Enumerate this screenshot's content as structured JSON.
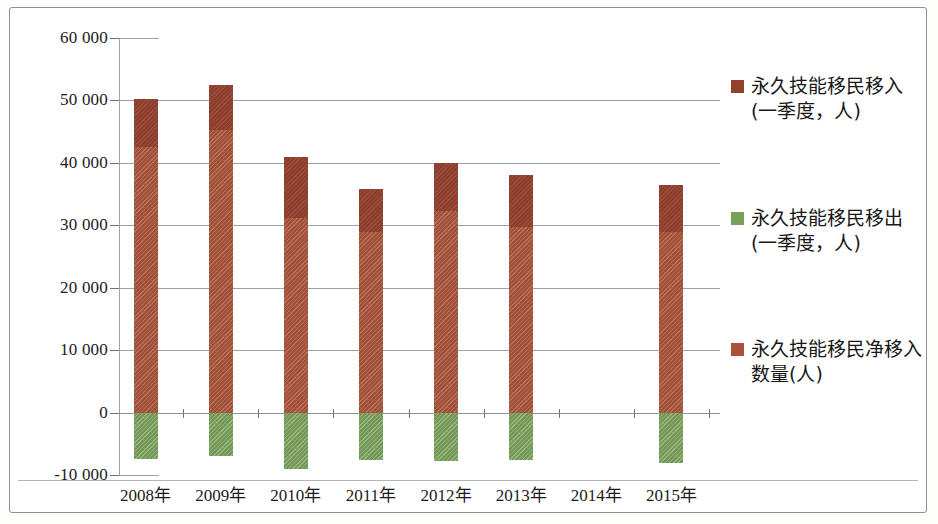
{
  "chart_data": {
    "type": "bar",
    "subtype": "stacked-positive-negative",
    "title": "",
    "xlabel": "",
    "ylabel": "",
    "ylim": [
      -10000,
      60000
    ],
    "ytick_step": 10000,
    "grid": true,
    "legend_position": "right",
    "categories": [
      "2008年",
      "2009年",
      "2010年",
      "2011年",
      "2012年",
      "2013年",
      "2014年",
      "2015年"
    ],
    "ytick_labels": [
      "60 000",
      "50 000",
      "40 000",
      "30 000",
      "20 000",
      "10 000",
      "0",
      "-10 000"
    ],
    "ytick_values": [
      60000,
      50000,
      40000,
      30000,
      20000,
      10000,
      0,
      -10000
    ],
    "series": [
      {
        "name": "永久技能移民移入\n(一季度，人)",
        "key": "inflow",
        "color": "#93402d",
        "values": [
          50200,
          52400,
          40900,
          35800,
          39900,
          38000,
          null,
          36400
        ],
        "note": "total bar top (darker upper segment top edge)"
      },
      {
        "name": "永久技能移民移出\n(一季度，人)",
        "key": "outflow",
        "color": "#79a05a",
        "values": [
          -7500,
          -7000,
          -9000,
          -7600,
          -7700,
          -7600,
          null,
          -8000
        ]
      },
      {
        "name": "永久技能移民净移入\n数量(人)",
        "key": "net_inflow",
        "color": "#a8533a",
        "values": [
          42500,
          45200,
          31200,
          29000,
          32300,
          29700,
          null,
          29000
        ],
        "note": "top edge of the lighter hatched segment"
      }
    ]
  },
  "legend": {
    "items": [
      {
        "label": "永久技能移民移入\n(一季度，人)",
        "color": "#93402d",
        "icon": "square-swatch-icon"
      },
      {
        "label": "永久技能移民移出\n(一季度，人)",
        "color": "#79a05a",
        "icon": "square-swatch-icon"
      },
      {
        "label": "永久技能移民净移入\n数量(人)",
        "color": "#a8533a",
        "icon": "square-swatch-icon"
      }
    ]
  }
}
